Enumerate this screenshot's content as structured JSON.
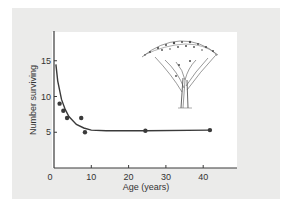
{
  "chart_data": {
    "type": "scatter",
    "title": "",
    "xlabel": "Age (years)",
    "ylabel": "Number surviving",
    "xlim": [
      0,
      48
    ],
    "ylim": [
      0,
      19
    ],
    "x_ticks": [
      0,
      10,
      20,
      30,
      40
    ],
    "y_ticks": [
      5,
      10,
      15
    ],
    "x_tick_labels": [
      "0",
      "10",
      "20",
      "30",
      "40"
    ],
    "y_tick_labels": [
      "5",
      "10",
      "15"
    ],
    "grid": false,
    "legend": null,
    "series": [
      {
        "name": "Observed survivors",
        "kind": "scatter",
        "points": [
          {
            "x": 1.5,
            "y": 9.0
          },
          {
            "x": 2.5,
            "y": 8.0
          },
          {
            "x": 3.5,
            "y": 7.0
          },
          {
            "x": 7.3,
            "y": 7.0
          },
          {
            "x": 8.3,
            "y": 5.0
          },
          {
            "x": 24.5,
            "y": 5.2
          },
          {
            "x": 41.8,
            "y": 5.3
          }
        ]
      },
      {
        "name": "Fitted survivorship curve",
        "kind": "line",
        "points": [
          {
            "x": 0.5,
            "y": 14.5
          },
          {
            "x": 1,
            "y": 12.2
          },
          {
            "x": 2,
            "y": 9.6
          },
          {
            "x": 3,
            "y": 8.2
          },
          {
            "x": 4,
            "y": 7.2
          },
          {
            "x": 6,
            "y": 6.1
          },
          {
            "x": 8,
            "y": 5.6
          },
          {
            "x": 10,
            "y": 5.3
          },
          {
            "x": 14,
            "y": 5.2
          },
          {
            "x": 24.5,
            "y": 5.2
          },
          {
            "x": 41.8,
            "y": 5.3
          }
        ]
      }
    ],
    "annotations": [
      "tree illustration (upper right)"
    ]
  },
  "colors": {
    "background": "#ffffff",
    "card": "#ebebea",
    "panel": "#ffffff",
    "ink": "#3a3a3a"
  }
}
